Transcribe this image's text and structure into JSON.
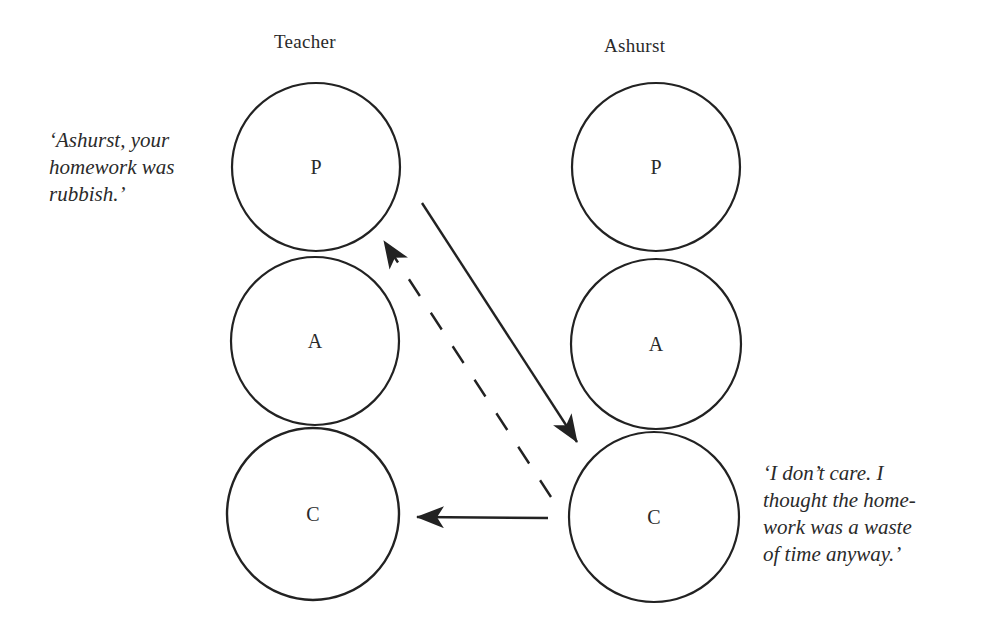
{
  "columns": [
    {
      "title": "Teacher",
      "states": [
        "P",
        "A",
        "C"
      ]
    },
    {
      "title": "Ashurst",
      "states": [
        "P",
        "A",
        "C"
      ]
    }
  ],
  "quotes": {
    "teacher": {
      "lines": [
        "‘Ashurst, your",
        "homework was",
        "rubbish.’"
      ]
    },
    "ashurst": {
      "lines": [
        "‘I don’t care. I",
        "thought the home-",
        "work was a waste",
        "of time anyway.’"
      ]
    }
  },
  "transactions": [
    {
      "from": "Teacher.P",
      "to": "Ashurst.C",
      "style": "solid"
    },
    {
      "from": "Ashurst.C",
      "to": "Teacher.P",
      "style": "dashed"
    },
    {
      "from": "Ashurst.C",
      "to": "Teacher.C",
      "style": "solid"
    }
  ],
  "colors": {
    "stroke": "#222222",
    "background": "#ffffff"
  }
}
